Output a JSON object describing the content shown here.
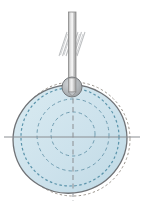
{
  "figure": {
    "title": "",
    "type": "mechanical-diagram",
    "background_color": "#ffffff",
    "canvas": {
      "width": 144,
      "height": 209
    }
  },
  "colors": {
    "disc_fill": "#cfe3ec",
    "disc_stroke": "#6f7276",
    "construction_dotted": "#9a948c",
    "construction_dashed_blue": "#5b94ab",
    "axis_line": "#8b8e92",
    "rod_fill": "#c9c9c9",
    "rod_stroke": "#8a8a8a",
    "rod_highlight": "#efefef",
    "roller_fill": "#b4b7ba",
    "roller_stroke": "#76797c",
    "hatch_stroke": "#b9bbbd"
  },
  "elements": {
    "follower_rod": {
      "name": "follower-rod",
      "label": "",
      "x": 68.5,
      "y_top": 12,
      "y_bottom": 92,
      "width": 7
    },
    "fixed_support_hatching": {
      "name": "fixed-support-hatching",
      "label": "",
      "y_top": 32,
      "y_bottom": 56,
      "left_x": 58,
      "right_x": 86,
      "line_count": 7
    },
    "roller_pivot": {
      "name": "roller-pivot",
      "label": "",
      "cx": 72,
      "cy": 87,
      "r": 10
    },
    "cam_disc": {
      "name": "cam-disc",
      "label": "",
      "cx": 70,
      "cy": 139,
      "rx": 57,
      "ry": 54,
      "rotation_deg": -12
    },
    "base_circle_dashed": {
      "name": "base-circle-dashed",
      "label": "",
      "cx": 70,
      "cy": 137,
      "r": 49
    },
    "pitch_circle_dotted_outer": {
      "name": "pitch-circle-dotted-outer",
      "label": "",
      "cx": 73,
      "cy": 139,
      "r": 57
    },
    "hub_circle_dashed": {
      "name": "hub-circle-dashed",
      "label": "",
      "cx": 73,
      "cy": 134,
      "r": 22
    },
    "mid_circle_dashed": {
      "name": "mid-circle-dashed",
      "label": "",
      "cx": 73,
      "cy": 135,
      "r": 36
    },
    "horizontal_axis": {
      "name": "horizontal-center-axis",
      "label": "",
      "x1": 4,
      "x2": 140,
      "y": 137
    },
    "vertical_axis": {
      "name": "vertical-center-axis",
      "label": "",
      "x": 73,
      "y1": 90,
      "y2": 200
    }
  },
  "annotations": [],
  "legend": []
}
